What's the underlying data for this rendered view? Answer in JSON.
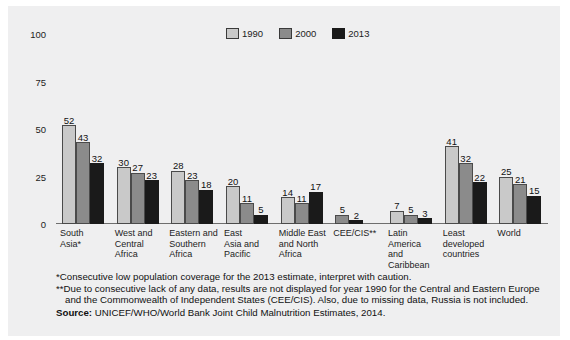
{
  "chart_data": {
    "type": "bar",
    "title": "",
    "subtitle": "",
    "xlabel": "",
    "ylabel": "",
    "ylim": [
      0,
      100
    ],
    "yticks": [
      0,
      25,
      50,
      75,
      100
    ],
    "grid": false,
    "legend_position": "top-center",
    "categories": [
      "South\nAsia*",
      "West and\nCentral\nAfrica",
      "Eastern and\nSouthern\nAfrica",
      "East\nAsia and\nPacific",
      "Middle East\nand North\nAfrica",
      "CEE/CIS**",
      "Latin\nAmerica\nand\nCaribbean",
      "Least\ndeveloped\ncountries",
      "World"
    ],
    "series": [
      {
        "name": "1990",
        "color": "#c9c9c9",
        "values": [
          52,
          30,
          28,
          20,
          14,
          null,
          7,
          41,
          25
        ],
        "labels": [
          "52",
          "30",
          "28",
          "20",
          "14",
          "",
          "7",
          "41",
          "25"
        ]
      },
      {
        "name": "2000",
        "color": "#8b8b8b",
        "values": [
          43,
          27,
          23,
          11,
          11,
          5,
          5,
          32,
          21
        ],
        "labels": [
          "43",
          "27",
          "23",
          "11",
          "11",
          "5",
          "5",
          "32",
          "21"
        ]
      },
      {
        "name": "2013",
        "color": "#1a1a1a",
        "values": [
          32,
          23,
          18,
          5,
          17,
          2,
          3,
          22,
          15
        ],
        "labels": [
          "32",
          "23",
          "18",
          "5",
          "17",
          "2",
          "3",
          "22",
          "15"
        ]
      }
    ]
  },
  "legend": {
    "items": [
      {
        "label": "1990",
        "color": "#c9c9c9"
      },
      {
        "label": "2000",
        "color": "#8b8b8b"
      },
      {
        "label": "2013",
        "color": "#1a1a1a"
      }
    ]
  },
  "notes": {
    "note1": "*Consecutive low population coverage for the 2013 estimate, interpret with caution.",
    "note2": "**Due to consecutive lack of any data, results are not displayed for year 1990 for the Central and Eastern Europe and the Commonwealth of Independent States (CEE/CIS). Also, due to missing data, Russia is not included.",
    "source_label": "Source:",
    "source_text": "UNICEF/WHO/World Bank Joint Child Malnutrition Estimates, 2014."
  }
}
